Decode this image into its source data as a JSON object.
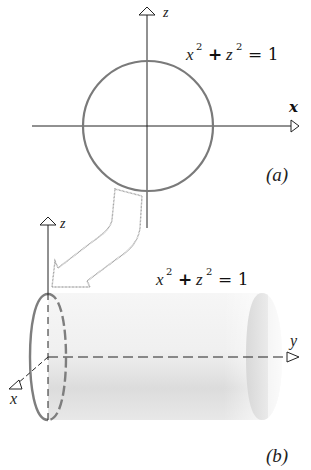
{
  "panel_a": {
    "axis_z_label": "z",
    "axis_x_label": "x",
    "equation": {
      "base1": "x",
      "exp1": "2",
      "plus": "+",
      "base2": "z",
      "exp2": "2",
      "eq": "= 1"
    },
    "caption": "(a)",
    "circle": {
      "cx": 148,
      "cy": 126,
      "r": 65,
      "color": "#7a7a7a"
    }
  },
  "panel_b": {
    "axis_z_label": "z",
    "axis_y_label": "y",
    "axis_x_label": "x",
    "equation": {
      "base1": "x",
      "exp1": "2",
      "plus": "+",
      "base2": "z",
      "exp2": "2",
      "eq": "= 1"
    },
    "caption": "(b)",
    "cylinder": {
      "shade_color": "#d8d8d8",
      "ellipse_color": "#808080"
    }
  },
  "connector_arrow": {
    "description": "hollow bent arrow from circle (a) to cylinder (b)"
  }
}
